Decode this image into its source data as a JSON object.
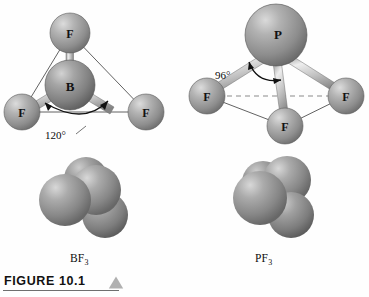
{
  "figure": {
    "caption_label": "FIGURE 10.1",
    "marker_icon": "triangle-up-icon"
  },
  "molecules": [
    {
      "id": "bf3",
      "formula_text": "BF",
      "formula_subscript": "3",
      "label": "BF3",
      "geometry": "trigonal planar",
      "central_atom": "B",
      "terminal_atom": "F",
      "bond_angle_value": "120",
      "bond_angle_unit": "°",
      "bond_angle_label": "120°",
      "atom_labels": [
        "F",
        "B",
        "F",
        "F"
      ]
    },
    {
      "id": "pf3",
      "formula_text": "PF",
      "formula_subscript": "3",
      "label": "PF3",
      "geometry": "trigonal pyramidal",
      "central_atom": "P",
      "terminal_atom": "F",
      "bond_angle_value": "96",
      "bond_angle_unit": "°",
      "bond_angle_label": "96°",
      "atom_labels": [
        "P",
        "F",
        "F",
        "F"
      ]
    }
  ],
  "colors": {
    "background": "#fefefe",
    "central_sphere": "#9a9a9a",
    "central_sphere_dark": "#6d6d6d",
    "terminal_sphere": "#a8a8a8",
    "terminal_sphere_dark": "#787878",
    "bond_light": "#e3e3e3",
    "bond_dark": "#8b8b8b",
    "outline": "#2b2b2b",
    "caption_text": "#111111",
    "caption_rule": "#6f6f6f",
    "marker_fill": "#b0b0b0"
  }
}
